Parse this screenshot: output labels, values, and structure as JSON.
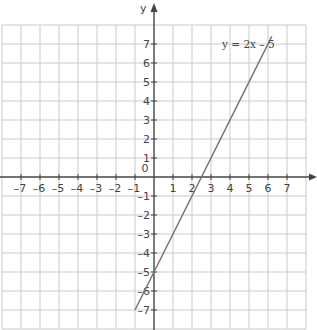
{
  "chart_data": {
    "type": "line",
    "title": "",
    "xlabel": "",
    "ylabel": "y",
    "xlim": [
      -8,
      8
    ],
    "ylim": [
      -8,
      8
    ],
    "grid": true,
    "x_ticks": [
      -7,
      -6,
      -5,
      -4,
      -3,
      -2,
      -1,
      1,
      2,
      3,
      4,
      5,
      6,
      7
    ],
    "y_ticks": [
      -7,
      -6,
      -5,
      -4,
      -3,
      -2,
      -1,
      1,
      2,
      3,
      4,
      5,
      6,
      7
    ],
    "origin_label": "0",
    "series": [
      {
        "name": "y = 2x – 5",
        "equation": "y = 2x - 5",
        "x": [
          -1,
          6.2
        ],
        "y": [
          -7,
          7.4
        ],
        "color": "#777777"
      }
    ],
    "annotations": [
      {
        "text": "y = 2x – 5",
        "x": 3.9,
        "y": 6.6
      }
    ]
  },
  "labels": {
    "y_axis": "y",
    "origin": "0",
    "equation": "y = 2x – 5"
  },
  "colors": {
    "grid": "#c9c9c9",
    "axis": "#444444",
    "line": "#777777"
  }
}
